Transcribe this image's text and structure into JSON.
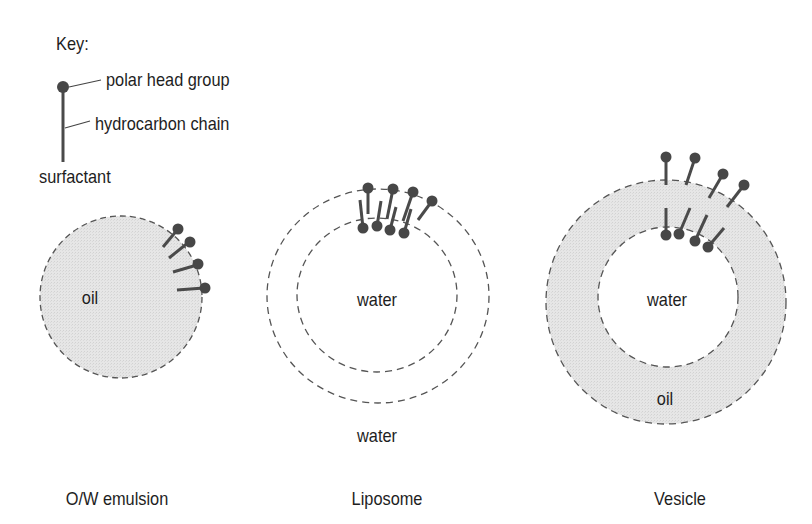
{
  "key": {
    "title": "Key:",
    "head_label": "polar head group",
    "chain_label": "hydrocarbon chain",
    "surfactant_label": "surfactant"
  },
  "colors": {
    "fill": "#e3e3e3",
    "stroke_dash": "#555555",
    "head": "#474747",
    "chain": "#4a4a4a",
    "text": "#1e1e1e"
  },
  "structures": [
    {
      "name": "O/W emulsion",
      "inner_label": "oil",
      "caption": "O/W emulsion"
    },
    {
      "name": "Liposome",
      "inner_label": "water",
      "outer_label": "water",
      "caption": "Liposome"
    },
    {
      "name": "Vesicle",
      "inner_label": "water",
      "shell_label": "oil",
      "caption": "Vesicle"
    }
  ]
}
